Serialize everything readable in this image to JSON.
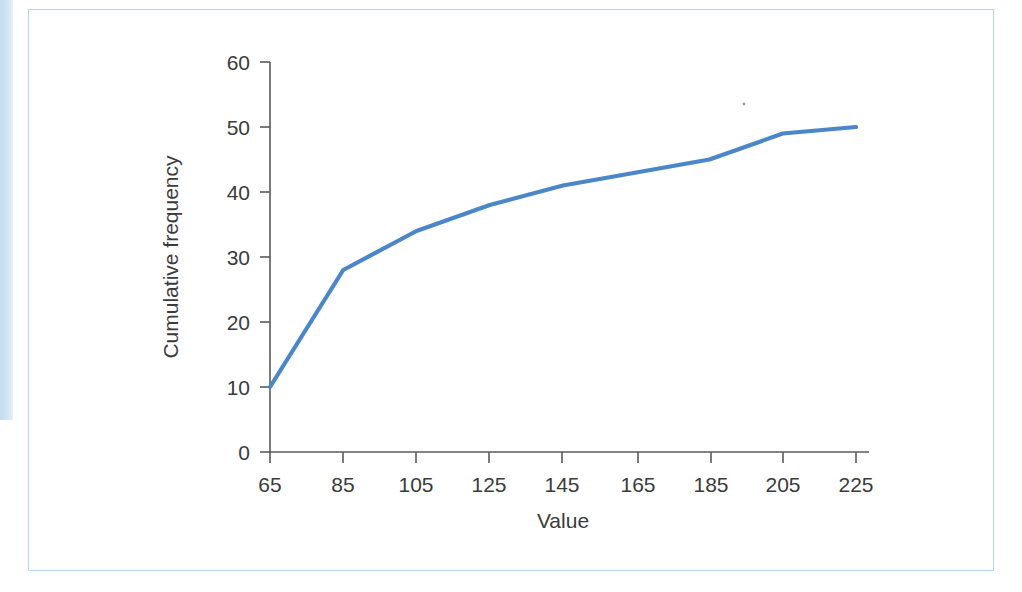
{
  "figure": {
    "frame_color": "#b9d3ea",
    "background": "#ffffff",
    "edge_bar_color": "#c3dcf0"
  },
  "chart_data": {
    "type": "line",
    "title": "",
    "subtitle": "",
    "xlabel": "Value",
    "ylabel": "Cumulative frequency",
    "x": [
      65,
      85,
      105,
      125,
      145,
      165,
      185,
      205,
      225
    ],
    "values": [
      10,
      28,
      34,
      38,
      41,
      43,
      45,
      49,
      50
    ],
    "series": [
      {
        "name": "Cumulative frequency",
        "color": "#4a86c8",
        "values": [
          10,
          28,
          34,
          38,
          41,
          43,
          45,
          49,
          50
        ]
      }
    ],
    "xticks": [
      "65",
      "85",
      "105",
      "125",
      "145",
      "165",
      "185",
      "205",
      "225"
    ],
    "yticks": [
      "0",
      "10",
      "20",
      "30",
      "40",
      "50",
      "60"
    ],
    "xlim": [
      55,
      235
    ],
    "ylim": [
      0,
      60
    ],
    "grid": false,
    "legend": false,
    "legend_position": "none",
    "line_color": "#4a86c8",
    "axis_color": "#5a5a5a"
  }
}
